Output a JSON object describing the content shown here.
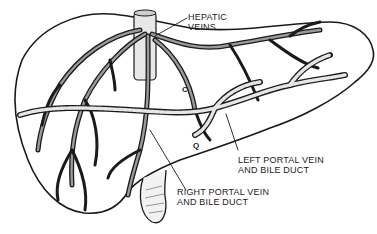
{
  "diagram": {
    "labels": {
      "hepatic_veins": {
        "line1": "HEPATIC",
        "line2": "VEINS"
      },
      "left_portal": {
        "line1": "LEFT PORTAL VEIN",
        "line2": "AND BILE DUCT"
      },
      "right_portal": {
        "line1": "RIGHT PORTAL VEIN",
        "line2": "AND BILE DUCT"
      }
    },
    "markers": {
      "c": "C",
      "q": "Q"
    },
    "colors": {
      "ink": "#1a1a1a",
      "background": "#ffffff",
      "vessel_fill": "#bdbdbd"
    }
  }
}
